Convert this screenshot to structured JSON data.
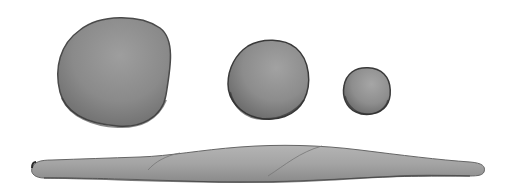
{
  "scene": {
    "description": "Illustration of three clay balls of decreasing size above a long rolled clay snake",
    "background": "#ffffff",
    "objects": [
      {
        "name": "large-ball",
        "color": "#8a8a8a",
        "outline": "#4a4a4a"
      },
      {
        "name": "medium-ball",
        "color": "#8c8c8c",
        "outline": "#3a3a3a"
      },
      {
        "name": "small-ball",
        "color": "#8e8e8e",
        "outline": "#3a3a3a"
      },
      {
        "name": "clay-coil",
        "color": "#a4a4a4",
        "outline": "#555555"
      }
    ]
  }
}
